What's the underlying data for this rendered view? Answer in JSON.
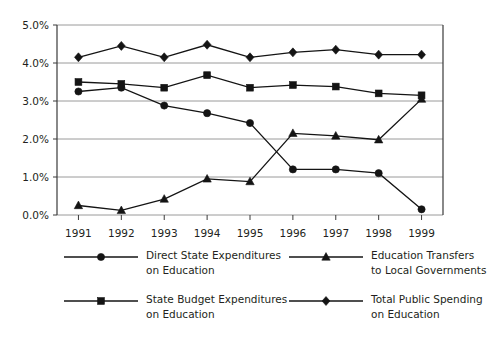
{
  "chart_data": {
    "type": "line",
    "title": "",
    "subtitle": "",
    "xlabel": "",
    "ylabel": "",
    "categories": [
      "1991",
      "1992",
      "1993",
      "1994",
      "1995",
      "1996",
      "1997",
      "1998",
      "1999"
    ],
    "x": [
      1991,
      1992,
      1993,
      1994,
      1995,
      1996,
      1997,
      1998,
      1999
    ],
    "ylim": [
      0.0,
      5.0
    ],
    "ytick_values": [
      0.0,
      1.0,
      2.0,
      3.0,
      4.0,
      5.0
    ],
    "ytick_labels": [
      "0.0%",
      "1.0%",
      "2.0%",
      "3.0%",
      "4.0%",
      "5.0%"
    ],
    "grid": true,
    "legend_position": "bottom",
    "series": [
      {
        "name": "Direct State Expenditures on Education",
        "marker": "circle",
        "color": "#141414",
        "values": [
          3.25,
          3.35,
          2.88,
          2.68,
          2.42,
          1.2,
          1.2,
          1.1,
          0.15
        ]
      },
      {
        "name": "State Budget Expenditures on Education",
        "marker": "square",
        "color": "#141414",
        "values": [
          3.5,
          3.45,
          3.35,
          3.68,
          3.35,
          3.42,
          3.38,
          3.2,
          3.15
        ]
      },
      {
        "name": "Education Transfers to Local Governments",
        "marker": "triangle",
        "color": "#141414",
        "values": [
          0.25,
          0.12,
          0.42,
          0.95,
          0.88,
          2.15,
          2.08,
          1.98,
          3.05
        ]
      },
      {
        "name": "Total Public Spending on Education",
        "marker": "diamond",
        "color": "#141414",
        "values": [
          4.15,
          4.45,
          4.15,
          4.48,
          4.15,
          4.28,
          4.35,
          4.22,
          4.22
        ]
      }
    ]
  },
  "legend": {
    "entries": [
      {
        "marker": "circle",
        "line1": "Direct State Expenditures",
        "line2": "on Education",
        "column": "left"
      },
      {
        "marker": "square",
        "line1": "State Budget Expenditures",
        "line2": "on Education",
        "column": "left"
      },
      {
        "marker": "triangle",
        "line1": "Education Transfers",
        "line2": "to Local Governments",
        "column": "right"
      },
      {
        "marker": "diamond",
        "line1": "Total Public Spending",
        "line2": "on Education",
        "column": "right"
      }
    ]
  },
  "colors": {
    "ink": "#141414",
    "grid": "#9a9a9a",
    "axis": "#3a3a3a",
    "background": "#ffffff",
    "text": "#231f20"
  }
}
